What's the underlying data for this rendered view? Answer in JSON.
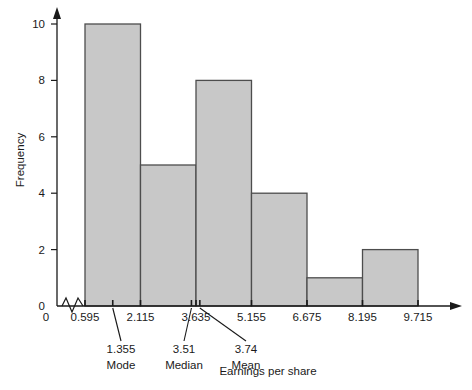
{
  "chart_data": {
    "type": "bar",
    "title": "",
    "subtitle": "",
    "xlabel": "Earnings per share",
    "ylabel": "Frequency",
    "grid": false,
    "legend": null,
    "bin_edges": [
      0.595,
      2.115,
      3.635,
      5.155,
      6.675,
      8.195,
      9.715
    ],
    "categories": [
      "0.595-2.115",
      "2.115-3.635",
      "3.635-5.155",
      "5.155-6.675",
      "6.675-8.195",
      "8.195-9.715"
    ],
    "values": [
      10,
      5,
      8,
      4,
      1,
      2
    ],
    "xlim": [
      0.595,
      9.715
    ],
    "ylim": [
      0,
      10
    ],
    "ytick_values": [
      0,
      2,
      4,
      6,
      8,
      10
    ],
    "ytick_labels": [
      "0",
      "2",
      "4",
      "6",
      "8",
      "10"
    ],
    "xtick_values": [
      0.595,
      2.115,
      3.635,
      5.155,
      6.675,
      8.195,
      9.715
    ],
    "xtick_labels": [
      "0.595",
      "2.115",
      "3.635",
      "5.155",
      "6.675",
      "8.195",
      "9.715"
    ],
    "x_axis_break": true,
    "x_origin_label": "0",
    "annotations": [
      {
        "value": 1.355,
        "value_label": "1.355",
        "name": "Mode",
        "leader": "vertical"
      },
      {
        "value": 3.51,
        "value_label": "3.51",
        "name": "Median",
        "leader": "diagonal-right"
      },
      {
        "value": 3.74,
        "value_label": "3.74",
        "name": "Mean",
        "leader": "diagonal-left"
      }
    ],
    "colors": {
      "bar_fill": "#c8c8c8",
      "bar_stroke": "#4d4d4d",
      "axis": "#1a1a1a",
      "text": "#1a1a1a",
      "background": "#ffffff"
    }
  }
}
